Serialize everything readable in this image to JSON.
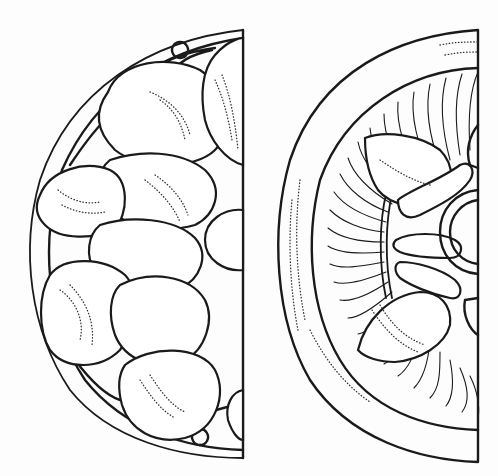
{
  "figure": {
    "panels": [
      {
        "id": "left",
        "motif": "lobed rosette with eight rounded petals, interlaced border and central boss"
      },
      {
        "id": "right",
        "motif": "fan-fluted border surrounding four-lobed cross and central ring boss"
      }
    ],
    "colors": {
      "ink": "#1a1a1a",
      "paper": "#fdfdfd"
    }
  }
}
